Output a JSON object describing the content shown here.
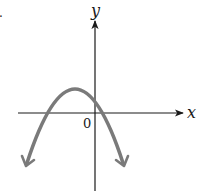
{
  "figure": {
    "type": "graph of a downward-opening parabola",
    "axis_labels": {
      "x": "x",
      "y": "y"
    },
    "origin_label": "0",
    "corner_mark": ".",
    "colors": {
      "axes": "#1a1a1a",
      "curve": "#7a7a7a",
      "background": "#ffffff"
    },
    "curve": {
      "shape": "parabola",
      "opens": "down",
      "vertex_position": "left of y-axis, above x-axis",
      "y_intercept": "positive",
      "roots": [
        "negative",
        "small positive"
      ],
      "end_behavior": "both ends arrow downward"
    }
  }
}
